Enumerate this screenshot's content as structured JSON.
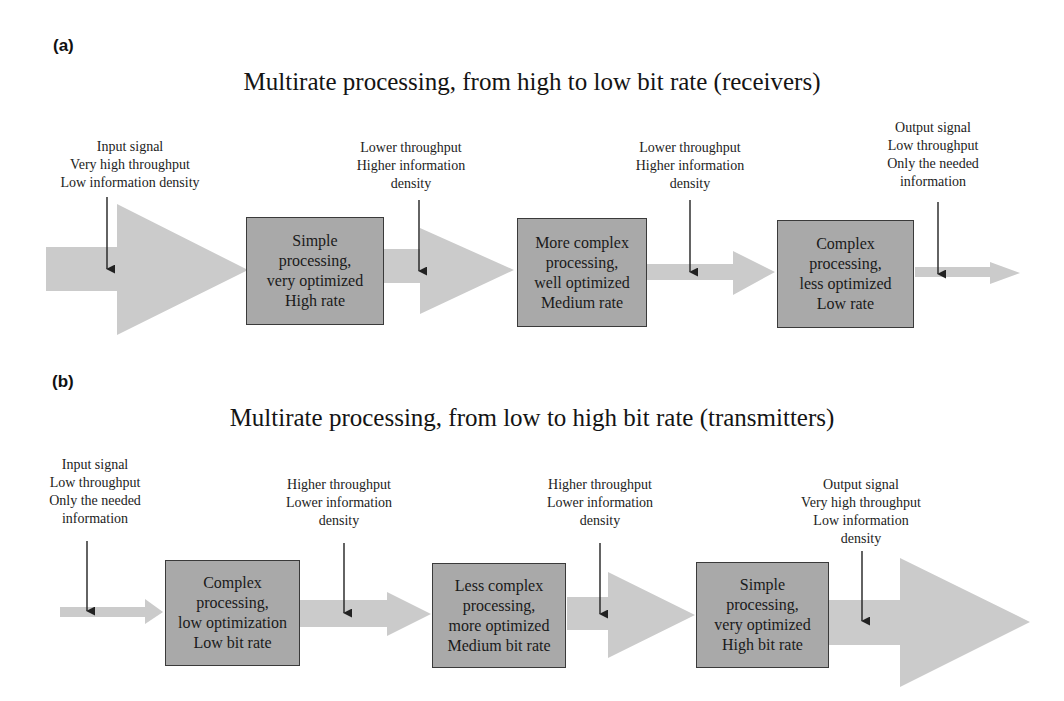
{
  "colors": {
    "arrow_fill": "#cbcbcb",
    "box_fill": "#a9a9a9",
    "box_border": "#3a3a3a",
    "pointer": "#222222",
    "background": "#ffffff"
  },
  "panel_a": {
    "label": "(a)",
    "title": "Multirate processing, from high to low bit rate (receivers)",
    "notes": [
      {
        "lines": [
          "Input signal",
          "Very high throughput",
          "Low information density"
        ]
      },
      {
        "lines": [
          "Lower throughput",
          "Higher information",
          "density"
        ]
      },
      {
        "lines": [
          "Lower throughput",
          "Higher information",
          "density"
        ]
      },
      {
        "lines": [
          "Output signal",
          "Low throughput",
          "Only the needed",
          "information"
        ]
      }
    ],
    "boxes": [
      {
        "lines": [
          "Simple",
          "processing,",
          "very optimized",
          "High rate"
        ]
      },
      {
        "lines": [
          "More complex",
          "processing,",
          "well optimized",
          "Medium rate"
        ]
      },
      {
        "lines": [
          "Complex",
          "processing,",
          "less optimized",
          "Low rate"
        ]
      }
    ]
  },
  "panel_b": {
    "label": "(b)",
    "title": "Multirate processing, from low to high bit rate (transmitters)",
    "notes": [
      {
        "lines": [
          "Input signal",
          "Low throughput",
          "Only the needed",
          "information"
        ]
      },
      {
        "lines": [
          "Higher throughput",
          "Lower information",
          "density"
        ]
      },
      {
        "lines": [
          "Higher throughput",
          "Lower information",
          "density"
        ]
      },
      {
        "lines": [
          "Output signal",
          "Very high throughput",
          "Low information",
          "density"
        ]
      }
    ],
    "boxes": [
      {
        "lines": [
          "Complex",
          "processing,",
          "low optimization",
          "Low bit rate"
        ]
      },
      {
        "lines": [
          "Less complex",
          "processing,",
          "more optimized",
          "Medium bit rate"
        ]
      },
      {
        "lines": [
          "Simple",
          "processing,",
          "very optimized",
          "High bit rate"
        ]
      }
    ]
  }
}
